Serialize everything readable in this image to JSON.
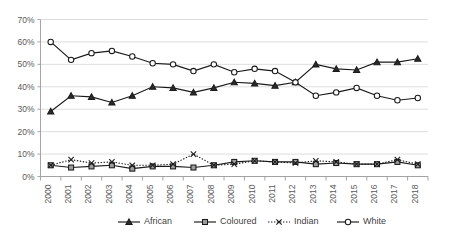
{
  "chart_data": {
    "type": "line",
    "title": "",
    "subtitle": "",
    "xlabel": "",
    "ylabel": "",
    "x": [
      2000,
      2001,
      2002,
      2003,
      2004,
      2005,
      2006,
      2007,
      2008,
      2009,
      2010,
      2011,
      2012,
      2013,
      2014,
      2015,
      2016,
      2017,
      2018
    ],
    "categories": [
      "2000",
      "2001",
      "2002",
      "2003",
      "2004",
      "2005",
      "2006",
      "2007",
      "2008",
      "2009",
      "2010",
      "2011",
      "2012",
      "2013",
      "2014",
      "2015",
      "2016",
      "2017",
      "2018"
    ],
    "ylim": [
      0,
      70
    ],
    "ytick_values": [
      0,
      10,
      20,
      30,
      40,
      50,
      60,
      70
    ],
    "ytick_labels": [
      "0%",
      "10%",
      "20%",
      "30%",
      "40%",
      "50%",
      "60%",
      "70%"
    ],
    "grid": true,
    "grid_axis": "y",
    "legend_position": "bottom",
    "series": [
      {
        "name": "African",
        "marker": "triangle",
        "line_style": "solid",
        "color": "#1a1a1a",
        "values": [
          29,
          36,
          35.5,
          33,
          36,
          40,
          39.5,
          37.5,
          39.5,
          42,
          41.5,
          40.5,
          42,
          50,
          48,
          47.5,
          51,
          51,
          52.5
        ]
      },
      {
        "name": "Coloured",
        "marker": "square",
        "line_style": "solid",
        "color": "#1a1a1a",
        "values": [
          5,
          4,
          4.5,
          5,
          3.5,
          4.5,
          4.5,
          4,
          5,
          6.5,
          7,
          6.5,
          6.5,
          5.5,
          6,
          5.5,
          5.5,
          6.5,
          5
        ]
      },
      {
        "name": "Indian",
        "marker": "x",
        "line_style": "dotted",
        "color": "#1a1a1a",
        "values": [
          5,
          7.5,
          6,
          6.5,
          5,
          5,
          5.5,
          10,
          5,
          5.5,
          7,
          6.5,
          6,
          7,
          6.5,
          5.5,
          5.5,
          7.5,
          5.5
        ]
      },
      {
        "name": "White",
        "marker": "circle",
        "line_style": "solid",
        "color": "#1a1a1a",
        "values": [
          60,
          52,
          55,
          56,
          53.5,
          50.5,
          50,
          47,
          50,
          46.5,
          48,
          47,
          42,
          36,
          37.5,
          39.5,
          36,
          34,
          35
        ]
      }
    ]
  },
  "legend": {
    "items": [
      {
        "label": "African"
      },
      {
        "label": "Coloured"
      },
      {
        "label": "Indian"
      },
      {
        "label": "White"
      }
    ]
  }
}
